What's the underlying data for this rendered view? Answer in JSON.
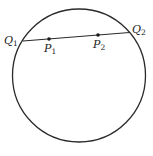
{
  "diagram": {
    "stroke_color": "#2a2a2a",
    "circle": {
      "cx": 79,
      "cy": 75.5,
      "r": 66.5
    },
    "chord": {
      "start": {
        "label": "Q",
        "subscript": "1",
        "x": 23,
        "y": 41
      },
      "end": {
        "label": "Q",
        "subscript": "2",
        "x": 129.5,
        "y": 32.5
      }
    },
    "points": [
      {
        "label": "P",
        "subscript": "1",
        "x": 49,
        "y": 39
      },
      {
        "label": "P",
        "subscript": "2",
        "x": 98,
        "y": 35
      }
    ],
    "labels": {
      "q1": {
        "main": "Q",
        "sub": "1"
      },
      "q2": {
        "main": "Q",
        "sub": "2"
      },
      "p1": {
        "main": "P",
        "sub": "1"
      },
      "p2": {
        "main": "P",
        "sub": "2"
      }
    }
  }
}
